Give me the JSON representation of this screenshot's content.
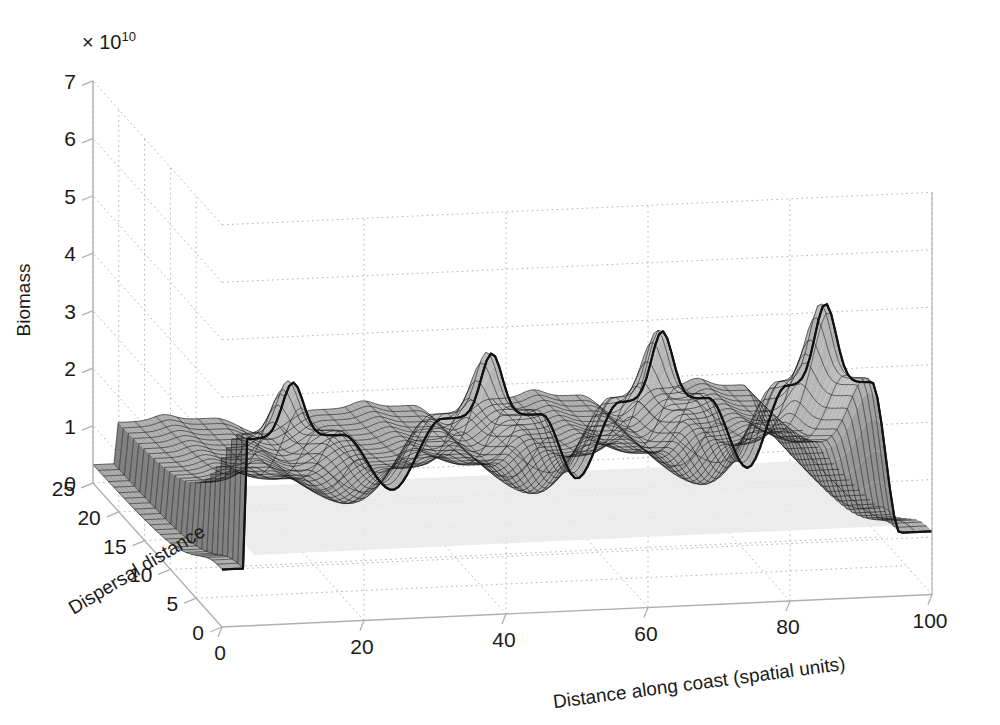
{
  "chart_data": {
    "type": "surface",
    "title": "",
    "xlabel": "Distance along coast (spatial units)",
    "ylabel": "Dispersal distance",
    "zlabel": "Biomass",
    "z_exponent_prefix": "× 10",
    "z_exponent_value": "10",
    "xlim": [
      0,
      100
    ],
    "ylim": [
      0,
      25
    ],
    "zlim": [
      0,
      7
    ],
    "xticks": [
      0,
      20,
      40,
      60,
      80,
      100
    ],
    "yticks": [
      0,
      5,
      10,
      15,
      20,
      25
    ],
    "zticks": [
      0,
      1,
      2,
      3,
      4,
      5,
      6,
      7
    ],
    "xtick_labels": [
      "0",
      "20",
      "40",
      "60",
      "80",
      "100"
    ],
    "ytick_labels": [
      "0",
      "5",
      "10",
      "15",
      "20",
      "25"
    ],
    "ztick_labels": [
      "0",
      "1",
      "2",
      "3",
      "4",
      "5",
      "6",
      "7"
    ],
    "grid": true,
    "grid_style": "dotted",
    "legend": "none",
    "y_axis_reversed": true,
    "surface_color_dark": "#6e6e6e",
    "surface_color_mid": "#9a9a9a",
    "surface_color_light": "#c9c9c9",
    "surface_color_pale": "#e2e2e2",
    "mesh_line_color": "#1a1a1a",
    "axis_line_color": "#b0b0b0",
    "grid_line_color": "#b5b5b5",
    "text_color": "#1a1a1a",
    "peaks": [
      {
        "x": 10,
        "z_peak": 4.15,
        "z_plateau": 3.25
      },
      {
        "x": 38,
        "z_peak": 4.5,
        "z_plateau": 3.45
      },
      {
        "x": 62,
        "z_peak": 4.75,
        "z_plateau": 3.6
      },
      {
        "x": 85,
        "z_peak": 5.1,
        "z_plateau": 3.75
      }
    ],
    "troughs": [
      {
        "x": 24,
        "z": 2.25
      },
      {
        "x": 50,
        "z": 2.3
      },
      {
        "x": 74,
        "z": 2.35
      }
    ],
    "edge_values": {
      "x_left": 1.0,
      "x_right": 1.1
    }
  },
  "axes": {
    "z_label": "Biomass",
    "y_label": "Dispersal distance",
    "x_label": "Distance along coast (spatial units)",
    "exponent_prefix": "× 10",
    "exponent_power": "10"
  }
}
